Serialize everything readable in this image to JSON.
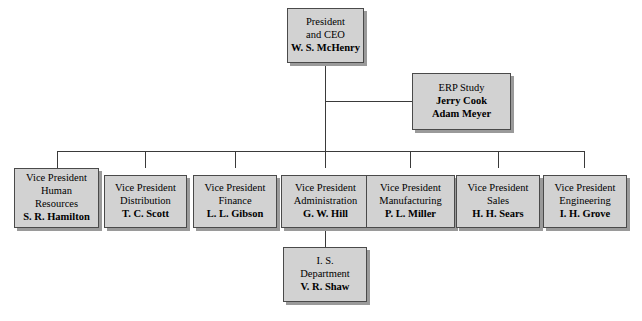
{
  "diagram": {
    "type": "organizational-chart",
    "colors": {
      "background": "#ffffff",
      "box_fill": "#d2d2d2",
      "box_border": "#4a4a4a",
      "box_shadow": "#9a9a9a",
      "connector": "#3a3a3a"
    }
  },
  "nodes": {
    "president": {
      "title_line1": "President",
      "title_line2": "and CEO",
      "person": "W. S. McHenry"
    },
    "erp_study": {
      "title_line1": "ERP Study",
      "person1": "Jerry Cook",
      "person2": "Adam Meyer"
    },
    "is_department": {
      "title_line1": "I. S.",
      "title_line2": "Department",
      "person": "V. R. Shaw"
    },
    "vps": [
      {
        "title_line1": "Vice President",
        "title_line2": "Human",
        "title_line3": "Resources",
        "person": "S. R. Hamilton"
      },
      {
        "title_line1": "Vice President",
        "title_line2": "Distribution",
        "person": "T. C. Scott"
      },
      {
        "title_line1": "Vice President",
        "title_line2": "Finance",
        "person": "L. L. Gibson"
      },
      {
        "title_line1": "Vice President",
        "title_line2": "Administration",
        "person": "G. W. Hill"
      },
      {
        "title_line1": "Vice President",
        "title_line2": "Manufacturing",
        "person": "P. L. Miller"
      },
      {
        "title_line1": "Vice President",
        "title_line2": "Sales",
        "person": "H. H. Sears"
      },
      {
        "title_line1": "Vice President",
        "title_line2": "Engineering",
        "person": "I. H. Grove"
      }
    ]
  }
}
